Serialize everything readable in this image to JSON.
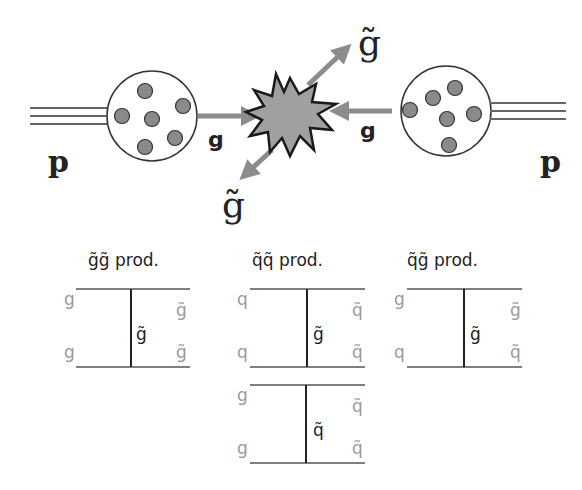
{
  "top_diagram": {
    "left_proton_label": "p",
    "right_proton_label": "p",
    "left_gluon_label": "g",
    "right_gluon_label": "g",
    "upper_gluino_label": "g̃",
    "lower_gluino_label": "g̃",
    "colors": {
      "arrow": "#8c8c8c",
      "parton": "#8a8a8a",
      "burst_fill": "#a0a0a0",
      "burst_stroke": "#1a1a1a",
      "line": "#555555"
    }
  },
  "feynman_diagrams": [
    {
      "title": "g̃g̃ prod.",
      "in_top": "g",
      "in_bottom": "g",
      "propagator": "g̃",
      "out_top": "g̃",
      "out_bottom": "g̃"
    },
    {
      "title": "q̃q̃ prod.",
      "in_top": "q",
      "in_bottom": "q",
      "propagator": "g̃",
      "out_top": "q̃",
      "out_bottom": "q̃"
    },
    {
      "title": "q̃g̃ prod.",
      "in_top": "g",
      "in_bottom": "q",
      "propagator": "g̃",
      "out_top": "g̃",
      "out_bottom": "q̃"
    },
    {
      "title": "",
      "in_top": "g",
      "in_bottom": "g",
      "propagator": "q̃",
      "out_top": "q̃",
      "out_bottom": "q̃"
    }
  ]
}
